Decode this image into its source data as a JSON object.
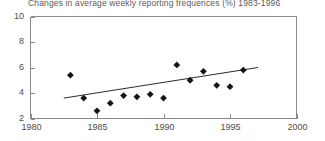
{
  "chart_data": {
    "type": "scatter",
    "title": "Changes in average weekly reporting frequences (%) 1983-1996",
    "xlabel": "",
    "ylabel": "",
    "xlim": [
      1980,
      2000
    ],
    "ylim": [
      2,
      10
    ],
    "grid": false,
    "legend": null,
    "x_ticks": [
      "1980",
      "1985",
      "1990",
      "1995",
      "2000"
    ],
    "x_tick_values": [
      1980,
      1985,
      1990,
      1995,
      2000
    ],
    "y_ticks": [
      "2",
      "4",
      "6",
      "8",
      "10"
    ],
    "y_tick_values": [
      2,
      4,
      6,
      8,
      10
    ],
    "marker": "diamond",
    "marker_color": "#151515",
    "trendline": {
      "present": true,
      "color": "#2b2b2b",
      "x_start": 1982.5,
      "y_start": 3.6,
      "x_end": 1997.1,
      "y_end": 6.0
    },
    "x": [
      1983,
      1984,
      1985,
      1986,
      1987,
      1988,
      1989,
      1990,
      1991,
      1992,
      1993,
      1994,
      1995,
      1996
    ],
    "values": [
      5.4,
      3.6,
      2.6,
      3.2,
      3.8,
      3.7,
      3.9,
      3.6,
      6.2,
      5.0,
      5.7,
      4.6,
      4.5,
      5.8
    ],
    "series": [
      {
        "name": "Average weekly reporting frequences (%)",
        "values": [
          5.4,
          3.6,
          2.6,
          3.2,
          3.8,
          3.7,
          3.9,
          3.6,
          6.2,
          5.0,
          5.7,
          4.6,
          4.5,
          5.8
        ]
      }
    ]
  }
}
